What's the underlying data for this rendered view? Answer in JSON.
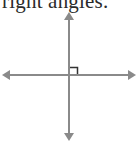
{
  "caption": {
    "text": "right angles."
  },
  "diagram": {
    "type": "perpendicular-axes",
    "line_color": "#8a8a8a",
    "marker_color": "#333333",
    "axes": [
      {
        "name": "vertical-line",
        "direction": "up-down"
      },
      {
        "name": "horizontal-line",
        "direction": "left-right"
      }
    ],
    "right_angle_marker": {
      "quadrant": "upper-right"
    }
  }
}
